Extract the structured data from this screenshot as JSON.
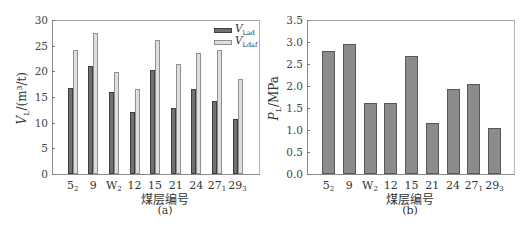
{
  "chart_data": [
    {
      "type": "bar",
      "panel": "(a)",
      "title": "",
      "xlabel": "煤层编号",
      "ylabel": "V_L/(m^3/t)",
      "ylim": [
        0,
        30
      ],
      "yticks": [
        0,
        5,
        10,
        15,
        20,
        25,
        30
      ],
      "grid": false,
      "legend_position": "upper right",
      "categories": [
        "5_2",
        "9",
        "W_2",
        "12",
        "15",
        "21",
        "24",
        "27_1",
        "29_3"
      ],
      "series": [
        {
          "name": "V_Lad",
          "color": "#707070",
          "values": [
            16.7,
            21.0,
            16.0,
            12.1,
            20.3,
            12.9,
            16.6,
            14.3,
            10.8
          ]
        },
        {
          "name": "V_Ldaf",
          "color": "#dedede",
          "values": [
            24.2,
            27.4,
            19.9,
            16.6,
            26.1,
            21.5,
            23.5,
            24.2,
            18.5
          ]
        }
      ]
    },
    {
      "type": "bar",
      "panel": "(b)",
      "title": "",
      "xlabel": "煤层编号",
      "ylabel": "P_L/MPa",
      "ylim": [
        0,
        3.5
      ],
      "yticks": [
        0.0,
        0.5,
        1.0,
        1.5,
        2.0,
        2.5,
        3.0,
        3.5
      ],
      "grid": false,
      "categories": [
        "5_2",
        "9",
        "W_2",
        "12",
        "15",
        "21",
        "24",
        "27_1",
        "29_3"
      ],
      "series": [
        {
          "name": "P_L",
          "color": "#8b8b8b",
          "values": [
            2.8,
            2.96,
            1.61,
            1.61,
            2.69,
            1.16,
            1.93,
            2.05,
            1.05
          ]
        }
      ]
    }
  ],
  "panels": {
    "a": {
      "caption": "(a)",
      "xlabel": "煤层编号",
      "ylabel_main": "V",
      "ylabel_sub": "L",
      "ylabel_unit": "/(m³/t)",
      "ytick_labels": [
        "0",
        "5",
        "10",
        "15",
        "20",
        "25",
        "30"
      ],
      "xtick_labels": [
        {
          "main": "5",
          "sub": "2"
        },
        {
          "main": "9",
          "sub": ""
        },
        {
          "main": "W",
          "sub": "2"
        },
        {
          "main": "12",
          "sub": ""
        },
        {
          "main": "15",
          "sub": ""
        },
        {
          "main": "21",
          "sub": ""
        },
        {
          "main": "24",
          "sub": ""
        },
        {
          "main": "27",
          "sub": "1"
        },
        {
          "main": "29",
          "sub": "3"
        }
      ],
      "legend": [
        {
          "main": "V",
          "sub": "Lad"
        },
        {
          "main": "V",
          "sub": "Ldaf"
        }
      ]
    },
    "b": {
      "caption": "(b)",
      "xlabel": "煤层编号",
      "ylabel_main": "P",
      "ylabel_sub": "L",
      "ylabel_unit": "/MPa",
      "ytick_labels": [
        "0.0",
        "0.5",
        "1.0",
        "1.5",
        "2.0",
        "2.5",
        "3.0",
        "3.5"
      ],
      "xtick_labels": [
        {
          "main": "5",
          "sub": "2"
        },
        {
          "main": "9",
          "sub": ""
        },
        {
          "main": "W",
          "sub": "2"
        },
        {
          "main": "12",
          "sub": ""
        },
        {
          "main": "15",
          "sub": ""
        },
        {
          "main": "21",
          "sub": ""
        },
        {
          "main": "24",
          "sub": ""
        },
        {
          "main": "27",
          "sub": "1"
        },
        {
          "main": "29",
          "sub": "3"
        }
      ]
    }
  }
}
